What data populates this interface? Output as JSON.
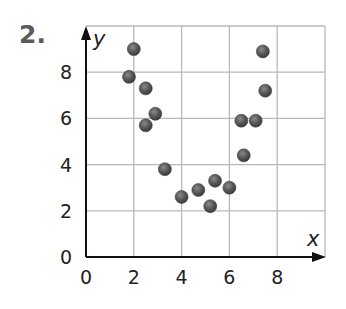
{
  "problem": {
    "number": "2."
  },
  "chart_data": {
    "type": "scatter",
    "title": "",
    "xlabel": "x",
    "ylabel": "y",
    "xlim": [
      0,
      10
    ],
    "ylim": [
      0,
      10
    ],
    "grid": true,
    "xticks": [
      "0",
      "2",
      "4",
      "6",
      "8"
    ],
    "yticks": [
      "0",
      "2",
      "4",
      "6",
      "8"
    ],
    "point_color": "#555555",
    "series": [
      {
        "name": "data",
        "points": [
          {
            "x": 2.0,
            "y": 9.0
          },
          {
            "x": 1.8,
            "y": 7.8
          },
          {
            "x": 2.5,
            "y": 7.3
          },
          {
            "x": 2.9,
            "y": 6.2
          },
          {
            "x": 2.5,
            "y": 5.7
          },
          {
            "x": 3.3,
            "y": 3.8
          },
          {
            "x": 4.0,
            "y": 2.6
          },
          {
            "x": 4.7,
            "y": 2.9
          },
          {
            "x": 5.4,
            "y": 3.3
          },
          {
            "x": 6.0,
            "y": 3.0
          },
          {
            "x": 5.2,
            "y": 2.2
          },
          {
            "x": 6.6,
            "y": 4.4
          },
          {
            "x": 6.5,
            "y": 5.9
          },
          {
            "x": 7.1,
            "y": 5.9
          },
          {
            "x": 7.5,
            "y": 7.2
          },
          {
            "x": 7.4,
            "y": 8.9
          }
        ]
      }
    ]
  }
}
